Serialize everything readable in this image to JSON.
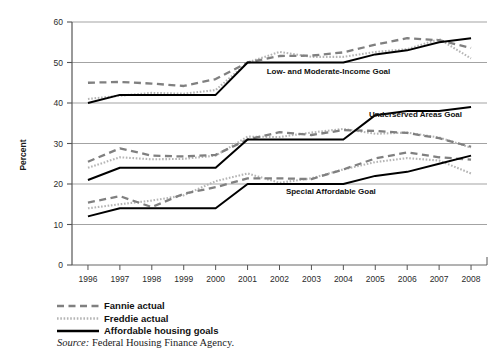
{
  "chart_data": {
    "type": "line",
    "title": "",
    "xlabel": "",
    "ylabel": "Percent",
    "ylim": [
      0,
      60
    ],
    "ytick_step": 10,
    "yticks": [
      "0",
      "10",
      "20",
      "30",
      "40",
      "50",
      "60"
    ],
    "grid": true,
    "legend_position": "below-plot-left",
    "categories": [
      "1996",
      "1997",
      "1998",
      "1999",
      "2000",
      "2001",
      "2002",
      "2003",
      "2004",
      "2005",
      "2006",
      "2007",
      "2008"
    ],
    "groups": [
      {
        "name": "Low- and Moderate-Income Goal",
        "annotation": "Low- and Moderate-Income Goal",
        "annotation_x": 2001.6,
        "annotation_y": 47.2,
        "series": [
          {
            "name": "Fannie actual",
            "style": "dashed",
            "values": [
              45.0,
              45.2,
              44.8,
              44.2,
              45.9,
              50.0,
              51.6,
              51.7,
              52.5,
              54.4,
              56.0,
              55.5,
              53.6
            ]
          },
          {
            "name": "Freddie actual",
            "style": "dotted",
            "values": [
              41.0,
              41.8,
              42.5,
              42.3,
              43.2,
              50.0,
              52.6,
              51.4,
              51.4,
              52.6,
              53.3,
              55.8,
              51.0
            ]
          },
          {
            "name": "Affordable housing goals",
            "style": "solid",
            "values": [
              40.0,
              42.0,
              42.0,
              42.0,
              42.0,
              50.0,
              50.0,
              50.0,
              50.0,
              52.0,
              53.0,
              55.0,
              56.0
            ]
          }
        ]
      },
      {
        "name": "Underserved Areas Goal",
        "annotation": "Underserved Areas Goal",
        "annotation_x": 2004.8,
        "annotation_y": 36.6,
        "series": [
          {
            "name": "Fannie actual",
            "style": "dashed",
            "values": [
              25.5,
              28.8,
              27.0,
              26.8,
              27.2,
              31.0,
              32.8,
              32.1,
              33.3,
              33.1,
              32.6,
              31.3,
              29.2
            ]
          },
          {
            "name": "Freddie actual",
            "style": "dotted",
            "values": [
              24.0,
              26.6,
              26.1,
              26.2,
              27.0,
              31.7,
              31.6,
              32.7,
              33.6,
              32.4,
              32.7,
              31.5,
              29.0
            ]
          },
          {
            "name": "Affordable housing goals",
            "style": "solid",
            "values": [
              21.0,
              24.0,
              24.0,
              24.0,
              24.0,
              31.0,
              31.0,
              31.0,
              31.0,
              37.0,
              38.0,
              38.0,
              39.0
            ]
          }
        ]
      },
      {
        "name": "Special Affordable Goal",
        "annotation": "Special Affordable Goal",
        "annotation_x": 2002.2,
        "annotation_y": 17.6,
        "series": [
          {
            "name": "Fannie actual",
            "style": "dashed",
            "values": [
              15.4,
              17.0,
              14.3,
              17.6,
              19.2,
              21.4,
              21.4,
              21.2,
              23.6,
              26.3,
              27.8,
              26.6,
              26.0
            ]
          },
          {
            "name": "Freddie actual",
            "style": "dotted",
            "values": [
              14.0,
              15.0,
              15.9,
              17.2,
              20.7,
              22.6,
              20.3,
              21.4,
              23.6,
              25.4,
              26.4,
              25.8,
              22.6
            ]
          },
          {
            "name": "Affordable housing goals",
            "style": "solid",
            "values": [
              12.0,
              14.0,
              14.0,
              14.0,
              14.0,
              20.0,
              20.0,
              20.0,
              20.0,
              22.0,
              23.0,
              25.0,
              27.0
            ]
          }
        ]
      }
    ]
  },
  "legend": {
    "entries": [
      {
        "label": "Fannie actual",
        "style": "dashed"
      },
      {
        "label": "Freddie actual",
        "style": "dotted"
      },
      {
        "label": "Affordable housing goals",
        "style": "solid"
      }
    ]
  },
  "source": {
    "prefix": "Source:",
    "text": "Federal Housing Finance Agency."
  },
  "colors": {
    "fannie": "#808080",
    "freddie": "#b5b5b5",
    "goals": "#000000",
    "grid": "#999999",
    "axis": "#555555",
    "text": "#111111"
  }
}
